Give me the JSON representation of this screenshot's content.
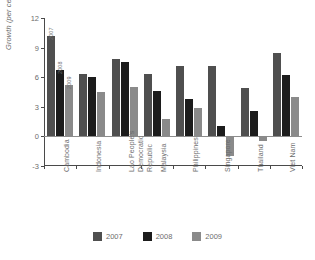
{
  "chart_data": {
    "type": "bar",
    "title": "",
    "xlabel": "",
    "ylabel": "Growth (per cent)",
    "ylim": [
      -3,
      12
    ],
    "yticks": [
      12,
      9,
      6,
      3,
      0,
      -3
    ],
    "grid": false,
    "legend_position": "bottom",
    "categories": [
      "Cambodia",
      "Indonesia",
      "Lao People's Democratic Republic",
      "Malaysia",
      "Philippines",
      "Singapore",
      "Thailand",
      "Viet Nam"
    ],
    "category_lines": [
      [
        "Cambodia"
      ],
      [
        "Indonesia"
      ],
      [
        "Lao People's",
        "Democratic",
        "Republic"
      ],
      [
        "Malaysia"
      ],
      [
        "Philippines"
      ],
      [
        "Singapore"
      ],
      [
        "Thailand"
      ],
      [
        "Viet Nam"
      ]
    ],
    "series": [
      {
        "name": "2007",
        "color": "#4f4f4f",
        "values": [
          10.2,
          6.3,
          7.8,
          6.3,
          7.1,
          7.1,
          4.9,
          8.5
        ]
      },
      {
        "name": "2008",
        "color": "#1c1c1c",
        "values": [
          6.7,
          6.0,
          7.5,
          4.6,
          3.8,
          1.1,
          2.6,
          6.2
        ]
      },
      {
        "name": "2009",
        "color": "#8a8a8a",
        "values": [
          5.2,
          4.5,
          5.0,
          1.8,
          2.9,
          -2.0,
          -0.5,
          4.0
        ]
      }
    ],
    "bar_annotations": [
      {
        "group": "Cambodia",
        "series": "2007",
        "text": "2007"
      },
      {
        "group": "Cambodia",
        "series": "2008",
        "text": "2008"
      },
      {
        "group": "Cambodia",
        "series": "2009",
        "text": "2009"
      }
    ]
  },
  "legend": {
    "items": [
      {
        "label": "2007",
        "color": "#4f4f4f"
      },
      {
        "label": "2008",
        "color": "#1c1c1c"
      },
      {
        "label": "2009",
        "color": "#8a8a8a"
      }
    ]
  },
  "axis": {
    "y_title": "Growth (per cent)",
    "y_tick_labels": [
      "12",
      "9",
      "6",
      "3",
      "0",
      "-3"
    ]
  }
}
